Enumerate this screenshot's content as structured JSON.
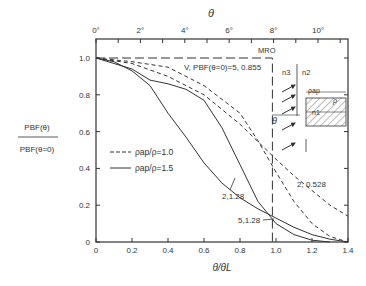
{
  "chart_data": {
    "type": "line",
    "title": "",
    "xlabel": "θ/θL",
    "x2label": "θ",
    "ylabel": "P_B^F(θ) / P_B^F(θ=0)",
    "ylabel_num": "PBF(θ)",
    "ylabel_den": "PBF(θ=0)",
    "xlim": [
      0,
      1.4
    ],
    "ylim": [
      0,
      1.1
    ],
    "x_ticks": [
      "0",
      "0.2",
      "0.4",
      "0.6",
      "0.8",
      "1.0",
      "1.2",
      "1.4"
    ],
    "y_ticks": [
      "0",
      "0.2",
      "0.4",
      "0.6",
      "0.8",
      "1.0"
    ],
    "top_ticks": [
      "0°",
      "2°",
      "4°",
      "6°",
      "8°",
      "10°"
    ],
    "grid": false,
    "legend": [
      {
        "style": "dashed",
        "label": "ρap/ρ=1.0"
      },
      {
        "style": "solid",
        "label": "ρap/ρ=1.5"
      }
    ],
    "annotations": [
      "MRO",
      "V, PBF(θ=0)=5, 0.855",
      "2, 0.528",
      "2,1.28",
      "5,1.28"
    ],
    "inset_labels": [
      "n3",
      "n2",
      "n1",
      "ρap",
      "ρ",
      "θ"
    ],
    "series": [
      {
        "name": "MRO",
        "style": "long-dash",
        "x": [
          0,
          0.98,
          0.98
        ],
        "y": [
          1.0,
          1.0,
          0.0
        ]
      },
      {
        "name": "5, 0.855",
        "style": "dashed",
        "x": [
          0,
          0.2,
          0.4,
          0.6,
          0.8,
          0.9,
          1.0,
          1.1,
          1.2,
          1.3,
          1.4
        ],
        "y": [
          1.0,
          0.98,
          0.95,
          0.85,
          0.7,
          0.55,
          0.38,
          0.22,
          0.1,
          0.03,
          0.0
        ]
      },
      {
        "name": "2, 0.528",
        "style": "dashed",
        "x": [
          0,
          0.2,
          0.4,
          0.6,
          0.8,
          1.0,
          1.1,
          1.2,
          1.3,
          1.4
        ],
        "y": [
          1.0,
          0.97,
          0.9,
          0.8,
          0.64,
          0.45,
          0.36,
          0.28,
          0.2,
          0.14
        ]
      },
      {
        "name": "2,1.28",
        "style": "solid",
        "x": [
          0,
          0.1,
          0.2,
          0.3,
          0.4,
          0.5,
          0.6,
          0.7,
          0.8,
          0.9,
          1.0,
          1.1,
          1.2,
          1.3,
          1.4
        ],
        "y": [
          1.0,
          0.98,
          0.93,
          0.85,
          0.7,
          0.57,
          0.43,
          0.32,
          0.24,
          0.18,
          0.13,
          0.08,
          0.04,
          0.015,
          0.0
        ]
      },
      {
        "name": "5,1.28",
        "style": "solid",
        "x": [
          0,
          0.2,
          0.3,
          0.4,
          0.5,
          0.6,
          0.7,
          0.8,
          0.9,
          1.0,
          1.1,
          1.2,
          1.3
        ],
        "y": [
          1.0,
          0.94,
          0.88,
          0.86,
          0.83,
          0.77,
          0.62,
          0.42,
          0.22,
          0.1,
          0.04,
          0.01,
          0.0
        ]
      }
    ]
  }
}
